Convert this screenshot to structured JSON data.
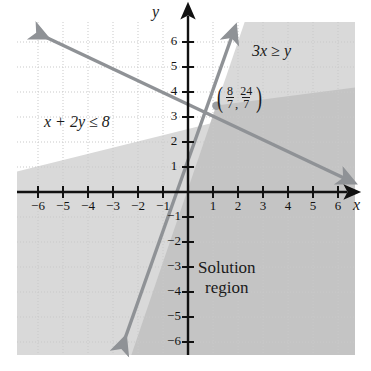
{
  "figure": {
    "axis_labels": {
      "x": "x",
      "y": "y"
    },
    "annotations": {
      "inequality_left": "x + 2y ≤ 8",
      "inequality_right": "3x ≥ y",
      "solution_line1": "Solution",
      "solution_line2": "region",
      "point_open_paren": "(",
      "point_close_paren": ")",
      "point_comma": ",",
      "point_x_numerator": "8",
      "point_x_denominator": "7",
      "point_y_numerator": "24",
      "point_y_denominator": "7"
    },
    "colors": {
      "line": "#8f9296",
      "axis": "#111111",
      "grid": "#c9c9c9",
      "shade_single": "#d8d8d8",
      "shade_overlap": "#c2c2c2",
      "background": "#ffffff",
      "text": "#1a1a1a"
    }
  },
  "chart_data": {
    "type": "line",
    "xlabel": "x",
    "ylabel": "y",
    "xlim": [
      -6.9,
      7.3
    ],
    "ylim": [
      -6.9,
      7.2
    ],
    "grid": true,
    "legend": "none",
    "xticks": [
      -6,
      -5,
      -4,
      -3,
      -2,
      -1,
      1,
      2,
      3,
      4,
      5,
      6
    ],
    "yticks": [
      -6,
      -5,
      -4,
      -3,
      -2,
      -1,
      1,
      2,
      3,
      4,
      5,
      6
    ],
    "xtick_labels": [
      "−6",
      "−5",
      "−4",
      "−3",
      "−2",
      "−1",
      "1",
      "2",
      "3",
      "4",
      "5",
      "6"
    ],
    "ytick_labels": [
      "−6",
      "−5",
      "−4",
      "−3",
      "−2",
      "−1",
      "1",
      "2",
      "3",
      "4",
      "5",
      "6"
    ],
    "series": [
      {
        "name": "x + 2y = 8",
        "equation": "x + 2y = 8",
        "inequality": "x + 2y ≤ 8",
        "slope": -0.5,
        "intercept": 4,
        "shaded_side": "below",
        "endpoints": [
          [
            -6.2,
            7.1
          ],
          [
            6.3,
            0.85
          ]
        ],
        "arrows": "both"
      },
      {
        "name": "y = 3x",
        "equation": "y = 3x",
        "inequality": "3x ≥ y",
        "slope": 3,
        "intercept": 0,
        "shaded_side": "below",
        "endpoints": [
          [
            -2.6,
            -6.2
          ],
          [
            1.75,
            6.3
          ]
        ],
        "arrows": "both"
      }
    ],
    "intersection_point": {
      "label": "(8/7, 24/7)",
      "x": 1.142857,
      "y": 3.428571,
      "x_fraction": "8/7",
      "y_fraction": "24/7"
    },
    "annotations": [
      {
        "text": "x + 2y ≤ 8",
        "x": -4.6,
        "y": 2.6
      },
      {
        "text": "3x ≥ y",
        "x": 3.0,
        "y": 5.5
      },
      {
        "text": "Solution region",
        "x": 3.2,
        "y": -3.2
      }
    ]
  }
}
